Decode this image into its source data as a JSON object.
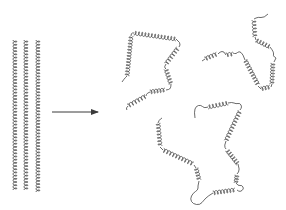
{
  "diagram": {
    "colors": {
      "stroke": "#3a3a3a",
      "background": "#ffffff"
    },
    "native_state": {
      "label": "",
      "strands": [
        {
          "x": 15,
          "y1": 40,
          "y2": 190
        },
        {
          "x": 26,
          "y1": 40,
          "y2": 190
        },
        {
          "x": 38,
          "y1": 40,
          "y2": 192
        }
      ]
    },
    "arrow": {
      "x1": 52,
      "y1": 112,
      "x2": 98,
      "y2": 112
    },
    "denatured_state": {
      "chains": [
        {
          "name": "chain-upper-left",
          "segments": [
            {
              "type": "coil",
              "pts": [
                [
                  122,
                  82
                ],
                [
                  124,
                  79
                ],
                [
                  127,
                  76
                ]
              ]
            },
            {
              "type": "helix",
              "from": [
                127,
                76
              ],
              "to": [
                131,
                36
              ]
            },
            {
              "type": "coil",
              "pts": [
                [
                  131,
                  36
                ],
                [
                  131,
                  33
                ],
                [
                  134,
                  33
                ]
              ]
            },
            {
              "type": "helix",
              "from": [
                134,
                33
              ],
              "to": [
                176,
                39
              ]
            },
            {
              "type": "coil",
              "pts": [
                [
                  176,
                  39
                ],
                [
                  181,
                  43
                ],
                [
                  179,
                  47
                ]
              ]
            },
            {
              "type": "helix",
              "from": [
                178,
                48
              ],
              "to": [
                166,
                64
              ]
            },
            {
              "type": "coil",
              "pts": [
                [
                  166,
                  64
                ],
                [
                  164,
                  67
                ],
                [
                  166,
                  69
                ]
              ]
            },
            {
              "type": "helix",
              "from": [
                166,
                69
              ],
              "to": [
                171,
                84
              ]
            },
            {
              "type": "coil",
              "pts": [
                [
                  171,
                  84
                ],
                [
                  171,
                  89
                ],
                [
                  166,
                  90
                ]
              ]
            },
            {
              "type": "helix",
              "from": [
                165,
                90
              ],
              "to": [
                150,
                92
              ]
            },
            {
              "type": "coil",
              "pts": [
                [
                  150,
                  92
                ],
                [
                  147,
                  93
                ],
                [
                  146,
                  96
                ]
              ]
            },
            {
              "type": "helix",
              "from": [
                146,
                96
              ],
              "to": [
                128,
                106
              ]
            },
            {
              "type": "coil",
              "pts": [
                [
                  128,
                  106
                ],
                [
                  126,
                  108
                ],
                [
                  127,
                  110
                ]
              ]
            }
          ]
        },
        {
          "name": "chain-upper-right",
          "segments": [
            {
              "type": "coil",
              "pts": [
                [
                  268,
                  14
                ],
                [
                  264,
                  18
                ],
                [
                  258,
                  17
                ],
                [
                  254,
                  19
                ]
              ]
            },
            {
              "type": "helix",
              "from": [
                254,
                20
              ],
              "to": [
                255,
                37
              ]
            },
            {
              "type": "coil",
              "pts": [
                [
                  255,
                  37
                ],
                [
                  256,
                  40
                ]
              ]
            },
            {
              "type": "helix",
              "from": [
                256,
                40
              ],
              "to": [
                270,
                47
              ]
            },
            {
              "type": "coil",
              "pts": [
                [
                  270,
                  47
                ],
                [
                  274,
                  52
                ],
                [
                  273,
                  56
                ],
                [
                  276,
                  58
                ]
              ]
            },
            {
              "type": "coil",
              "pts": [
                [
                  276,
                  58
                ],
                [
                  274,
                  62
                ]
              ]
            },
            {
              "type": "helix",
              "from": [
                273,
                63
              ],
              "to": [
                272,
                84
              ]
            },
            {
              "type": "coil",
              "pts": [
                [
                  272,
                  84
                ],
                [
                  271,
                  87
                ]
              ]
            },
            {
              "type": "helix",
              "from": [
                270,
                87
              ],
              "to": [
                261,
                89
              ]
            },
            {
              "type": "coil",
              "pts": [
                [
                  261,
                  89
                ],
                [
                  258,
                  86
                ]
              ]
            },
            {
              "type": "helix",
              "from": [
                258,
                85
              ],
              "to": [
                245,
                60
              ]
            },
            {
              "type": "coil",
              "pts": [
                [
                  245,
                  60
                ],
                [
                  243,
                  54
                ],
                [
                  239,
                  51
                ],
                [
                  236,
                  54
                ],
                [
                  233,
                  53
                ]
              ]
            },
            {
              "type": "helix",
              "from": [
                233,
                54
              ],
              "to": [
                226,
                55
              ]
            },
            {
              "type": "coil",
              "pts": [
                [
                  226,
                  55
                ],
                [
                  224,
                  51
                ],
                [
                  220,
                  52
                ],
                [
                  218,
                  54
                ]
              ]
            },
            {
              "type": "helix",
              "from": [
                217,
                54
              ],
              "to": [
                205,
                59
              ]
            },
            {
              "type": "coil",
              "pts": [
                [
                  205,
                  59
                ],
                [
                  202,
                  61
                ]
              ]
            }
          ]
        },
        {
          "name": "chain-bottom",
          "segments": [
            {
              "type": "coil",
              "pts": [
                [
                  195,
                  118
                ],
                [
                  194,
                  112
                ],
                [
                  196,
                  106
                ],
                [
                  201,
                  105
                ],
                [
                  204,
                  108
                ],
                [
                  208,
                  107
                ]
              ]
            },
            {
              "type": "helix",
              "from": [
                208,
                107
              ],
              "to": [
                228,
                103
              ]
            },
            {
              "type": "coil",
              "pts": [
                [
                  228,
                  103
                ],
                [
                  232,
                  102
                ],
                [
                  236,
                  104
                ],
                [
                  240,
                  103
                ],
                [
                  242,
                  107
                ],
                [
                  240,
                  110
                ]
              ]
            },
            {
              "type": "helix",
              "from": [
                240,
                111
              ],
              "to": [
                226,
                141
              ]
            },
            {
              "type": "coil",
              "pts": [
                [
                  226,
                  141
                ],
                [
                  224,
                  146
                ],
                [
                  226,
                  149
                ]
              ]
            },
            {
              "type": "helix",
              "from": [
                227,
                150
              ],
              "to": [
                238,
                164
              ]
            },
            {
              "type": "coil",
              "pts": [
                [
                  238,
                  164
                ],
                [
                  240,
                  170
                ],
                [
                  237,
                  174
                ]
              ]
            },
            {
              "type": "helix",
              "from": [
                237,
                175
              ],
              "to": [
                236,
                183
              ]
            },
            {
              "type": "coil",
              "pts": [
                [
                  236,
                  183
                ],
                [
                  238,
                  186
                ],
                [
                  242,
                  185
                ],
                [
                  244,
                  189
                ],
                [
                  240,
                  192
                ],
                [
                  237,
                  190
                ]
              ]
            },
            {
              "type": "helix",
              "from": [
                235,
                190
              ],
              "to": [
                213,
                193
              ]
            },
            {
              "type": "coil",
              "pts": [
                [
                  213,
                  193
                ],
                [
                  208,
                  196
                ],
                [
                  204,
                  200
                ],
                [
                  200,
                  205
                ],
                [
                  193,
                  204
                ],
                [
                  190,
                  199
                ],
                [
                  193,
                  193
                ],
                [
                  198,
                  190
                ],
                [
                  198,
                  186
                ]
              ]
            },
            {
              "type": "coil",
              "pts": [
                [
                  198,
                  186
                ],
                [
                  199,
                  181
                ]
              ]
            },
            {
              "type": "helix",
              "from": [
                199,
                180
              ],
              "to": [
                196,
                168
              ]
            },
            {
              "type": "coil",
              "pts": [
                [
                  196,
                  168
                ],
                [
                  194,
                  165
                ]
              ]
            },
            {
              "type": "helix",
              "from": [
                193,
                164
              ],
              "to": [
                163,
                150
              ]
            },
            {
              "type": "coil",
              "pts": [
                [
                  163,
                  150
                ],
                [
                  160,
                  147
                ]
              ]
            },
            {
              "type": "helix",
              "from": [
                160,
                146
              ],
              "to": [
                158,
                123
              ]
            },
            {
              "type": "coil",
              "pts": [
                [
                  158,
                  123
                ],
                [
                  159,
                  120
                ],
                [
                  162,
                  118
                ]
              ]
            }
          ]
        }
      ]
    }
  }
}
